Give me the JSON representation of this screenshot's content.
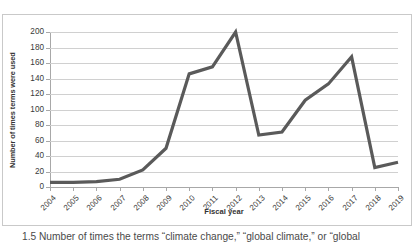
{
  "chart_data": {
    "type": "line",
    "title": "",
    "xlabel": "Fiscal year",
    "ylabel": "Number of times terms were used",
    "categories": [
      "2004",
      "2005",
      "2006",
      "2007",
      "2008",
      "2009",
      "2010",
      "2011",
      "2012",
      "2013",
      "2014",
      "2015",
      "2016",
      "2017",
      "2018",
      "2019"
    ],
    "values": [
      6,
      6,
      7,
      10,
      22,
      50,
      146,
      155,
      200,
      67,
      71,
      112,
      133,
      168,
      25,
      32
    ],
    "ylim": [
      0,
      200
    ],
    "y_ticks": [
      0,
      20,
      40,
      60,
      80,
      100,
      120,
      140,
      160,
      180,
      200
    ],
    "grid": true,
    "legend": "none",
    "series_color": "#5a5a5a",
    "grid_color": "#d0d0d0",
    "axis_color": "#a8a8a8"
  },
  "caption": {
    "text": "1.5  Number of times the terms “climate change,” “global climate,” or “global"
  }
}
